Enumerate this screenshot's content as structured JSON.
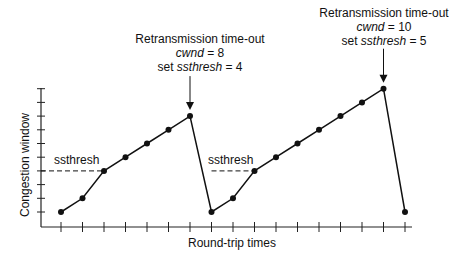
{
  "chart_data": {
    "type": "line",
    "title": "",
    "xlabel": "Round-trip times",
    "ylabel": "Congestion window",
    "x": [
      1,
      2,
      3,
      4,
      5,
      6,
      7,
      8,
      9,
      10,
      11,
      12,
      13,
      14,
      15,
      16,
      17
    ],
    "series": [
      {
        "name": "cwnd",
        "values": [
          1,
          2,
          4,
          5,
          6,
          7,
          8,
          1,
          2,
          4,
          5,
          6,
          7,
          8,
          9,
          10,
          1
        ]
      }
    ],
    "ylim": [
      0,
      10
    ],
    "xlim": [
      0,
      17
    ],
    "y_ticks": 10,
    "x_ticks": 17,
    "grid": false,
    "ssthresh_lines": [
      {
        "label": "ssthresh",
        "value": 4,
        "x_start": 0,
        "x_end": 3
      },
      {
        "label": "ssthresh",
        "value": 4,
        "x_start": 8,
        "x_end": 10
      }
    ],
    "annotations": [
      {
        "x": 7,
        "y": 8,
        "line1": "Retransmission time-out",
        "cwnd_label": "cwnd",
        "cwnd_value": "= 8",
        "set_label": "set",
        "ssthresh_label": "ssthresh",
        "ssthresh_value": "= 4"
      },
      {
        "x": 16,
        "y": 10,
        "line1": "Retransmission time-out",
        "cwnd_label": "cwnd",
        "cwnd_value": "= 10",
        "set_label": "set",
        "ssthresh_label": "ssthresh",
        "ssthresh_value": "= 5"
      }
    ]
  },
  "labels": {
    "xlabel": "Round-trip times",
    "ylabel": "Congestion window",
    "ssthresh1": "ssthresh",
    "ssthresh2": "ssthresh",
    "a1_line1": "Retransmission time-out",
    "a1_cwnd": "cwnd",
    "a1_cwnd_val": " = 8",
    "a1_set": "set ",
    "a1_ss": "ssthresh",
    "a1_ss_val": " = 4",
    "a2_line1": "Retransmission time-out",
    "a2_cwnd": "cwnd",
    "a2_cwnd_val": " = 10",
    "a2_set": "set ",
    "a2_ss": "ssthresh",
    "a2_ss_val": " = 5"
  },
  "colors": {
    "line": "#111111",
    "axis": "#222222",
    "text": "#111111"
  }
}
